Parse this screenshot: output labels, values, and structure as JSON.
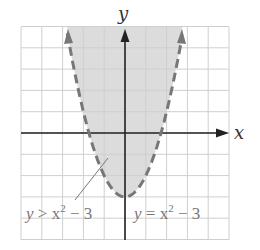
{
  "chart_data": {
    "type": "area",
    "title": "",
    "xlabel": "x",
    "ylabel": "y",
    "xlim": [
      -5,
      5
    ],
    "ylim": [
      -5,
      5
    ],
    "grid": true,
    "grid_step": 1,
    "boundary": {
      "equation": "y = x^2 - 3",
      "style": "dashed",
      "vertex": [
        0,
        -3
      ],
      "x_intercepts": [
        -1.732,
        1.732
      ]
    },
    "shaded_region": {
      "inequality": "y > x^2 - 3",
      "side": "above"
    },
    "annotations": [
      {
        "text": "y > x² − 3",
        "points_to": [
          -1.6,
          -0.5
        ]
      },
      {
        "text": "y = x² − 3",
        "position": "right of vertex"
      }
    ]
  },
  "labels": {
    "x_axis": "x",
    "y_axis": "y",
    "inequality_label_y": "y",
    "inequality_label_op": " > x",
    "inequality_label_exp": "2",
    "inequality_label_rest": " − 3",
    "equation_label_y": "y",
    "equation_label_op": " = x",
    "equation_label_exp": "2",
    "equation_label_rest": " − 3"
  },
  "colors": {
    "shade": "#dcdcdc",
    "grid": "#cfcfcf",
    "axis": "#222222",
    "curve": "#777777",
    "label": "#777777"
  }
}
